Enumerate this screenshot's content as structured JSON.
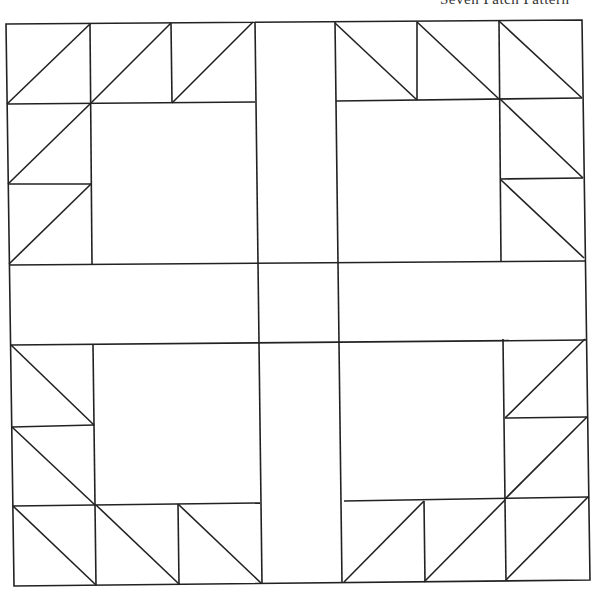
{
  "caption": "Seven Patch Pattern",
  "diagram": {
    "type": "quilt-block",
    "grid": "7x7",
    "components": [
      "half-square triangles",
      "center squares",
      "sashing strips",
      "center square"
    ],
    "stroke_color": "#222222",
    "background": "#ffffff"
  }
}
